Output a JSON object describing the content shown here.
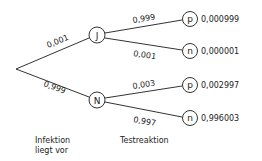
{
  "tree": {
    "root": {
      "x": 16,
      "y": 69
    },
    "level1": [
      {
        "label": "J",
        "prob": "0,001",
        "x": 97,
        "y": 35
      },
      {
        "label": "N",
        "prob": "0,999",
        "x": 97,
        "y": 100
      }
    ],
    "level2": [
      {
        "label": "p",
        "prob": "0,999",
        "result": "0,000999",
        "x": 190,
        "y": 19
      },
      {
        "label": "n",
        "prob": "0,001",
        "result": "0,000001",
        "x": 190,
        "y": 51
      },
      {
        "label": "p",
        "prob": "0,003",
        "result": "0,002997",
        "x": 190,
        "y": 85
      },
      {
        "label": "n",
        "prob": "0,997",
        "result": "0,996003",
        "x": 190,
        "y": 118
      }
    ]
  },
  "captions": {
    "infektion_line1": "Infektion",
    "infektion_line2": "liegt vor",
    "testreaktion": "Testreaktion"
  }
}
